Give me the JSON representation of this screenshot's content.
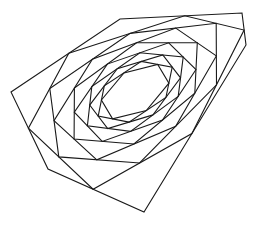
{
  "figure": {
    "type": "nested-polygon-whirl",
    "stroke_color": "#1a1a1a",
    "background_color": "#ffffff",
    "outer_polygon": [
      [
        11,
        92
      ],
      [
        120,
        19
      ],
      [
        242,
        13
      ],
      [
        246,
        45
      ],
      [
        144,
        212
      ],
      [
        48,
        169
      ]
    ],
    "fraction": 0.53,
    "levels": 10
  }
}
